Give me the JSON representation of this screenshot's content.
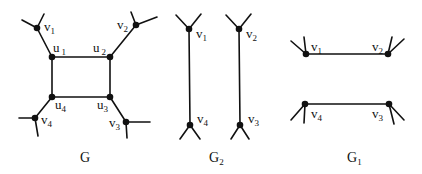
{
  "graphs": {
    "G": {
      "caption": "G",
      "labels": {
        "v1": {
          "base": "v",
          "sub": "1"
        },
        "v2": {
          "base": "v",
          "sub": "2"
        },
        "v3": {
          "base": "v",
          "sub": "3"
        },
        "v4": {
          "base": "v",
          "sub": "4"
        },
        "u1": {
          "base": "u",
          "sub": "1"
        },
        "u2": {
          "base": "u",
          "sub": "2"
        },
        "u3": {
          "base": "u",
          "sub": "3"
        },
        "u4": {
          "base": "u",
          "sub": "4"
        }
      }
    },
    "G2": {
      "caption": "G",
      "caption_sub": "2",
      "labels": {
        "v1": {
          "base": "v",
          "sub": "1"
        },
        "v2": {
          "base": "v",
          "sub": "2"
        },
        "v3": {
          "base": "v",
          "sub": "3"
        },
        "v4": {
          "base": "v",
          "sub": "4"
        }
      }
    },
    "G1": {
      "caption": "G",
      "caption_sub": "1",
      "labels": {
        "v1": {
          "base": "v",
          "sub": "1"
        },
        "v2": {
          "base": "v",
          "sub": "2"
        },
        "v3": {
          "base": "v",
          "sub": "3"
        },
        "v4": {
          "base": "v",
          "sub": "4"
        }
      }
    }
  }
}
